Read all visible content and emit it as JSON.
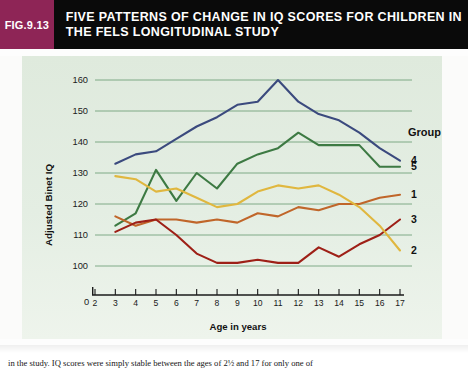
{
  "header": {
    "figure_tag": "FIG.9.13",
    "title_line1": "FIVE PATTERNS OF CHANGE IN IQ SCORES FOR CHILDREN IN",
    "title_line2": "THE FELS LONGITUDINAL STUDY",
    "tag_color": "#8e2556",
    "bar_color": "#0a0a0a"
  },
  "source_credit": "Source: McCall et al. (1973).",
  "caption": {
    "text": "in the study. IQ scores were simply stable between the ages of 2½ and 17 for only one of"
  },
  "legend": {
    "title": "Group",
    "entries": [
      {
        "label": "4",
        "color": "#3b4a7e"
      },
      {
        "label": "5",
        "color": "#3d7a43"
      },
      {
        "label": "1",
        "color": "#c0662a"
      },
      {
        "label": "3",
        "color": "#9e2017"
      },
      {
        "label": "2",
        "color": "#e0b73f"
      }
    ]
  },
  "chart_data": {
    "type": "line",
    "title": "Five patterns of change in IQ scores for children in the Fels Longitudinal Study",
    "xlabel": "Age in years",
    "ylabel": "Adjusted Binet IQ",
    "xlim": [
      2,
      17
    ],
    "ylim": [
      95,
      165
    ],
    "y_axis_origin_label": "0",
    "yticks": [
      100,
      110,
      120,
      130,
      140,
      150,
      160
    ],
    "xticks": [
      2,
      3,
      4,
      5,
      6,
      7,
      8,
      9,
      10,
      11,
      12,
      13,
      14,
      15,
      16,
      17
    ],
    "grid": true,
    "grid_color": "#4e8a5a",
    "legend_position": "right",
    "x": [
      3,
      4,
      5,
      6,
      7,
      8,
      9,
      10,
      11,
      12,
      13,
      14,
      15,
      16,
      17
    ],
    "series": [
      {
        "name": "Group 4",
        "label": "4",
        "color": "#3b4a7e",
        "x": [
          3,
          4,
          5,
          6,
          7,
          8,
          9,
          10,
          11,
          12,
          13,
          14,
          15,
          16,
          17
        ],
        "values": [
          133,
          136,
          137,
          141,
          145,
          148,
          152,
          153,
          160,
          153,
          149,
          147,
          143,
          138,
          134
        ]
      },
      {
        "name": "Group 5",
        "label": "5",
        "color": "#3d7a43",
        "x": [
          3,
          4,
          5,
          6,
          7,
          8,
          9,
          10,
          11,
          12,
          13,
          14,
          15,
          16,
          17
        ],
        "values": [
          113,
          117,
          131,
          121,
          130,
          125,
          133,
          136,
          138,
          143,
          139,
          139,
          139,
          132,
          132
        ]
      },
      {
        "name": "Group 1",
        "label": "1",
        "color": "#c0662a",
        "x": [
          3,
          4,
          5,
          6,
          7,
          8,
          9,
          10,
          11,
          12,
          13,
          14,
          15,
          16,
          17
        ],
        "values": [
          116,
          113,
          115,
          115,
          114,
          115,
          114,
          117,
          116,
          119,
          118,
          120,
          120,
          122,
          123
        ]
      },
      {
        "name": "Group 3",
        "label": "3",
        "color": "#9e2017",
        "x": [
          3,
          4,
          5,
          6,
          7,
          8,
          9,
          10,
          11,
          12,
          13,
          14,
          15,
          16,
          17
        ],
        "values": [
          111,
          114,
          115,
          110,
          104,
          101,
          101,
          102,
          101,
          101,
          106,
          103,
          107,
          110,
          115
        ]
      },
      {
        "name": "Group 2",
        "label": "2",
        "color": "#e0b73f",
        "x": [
          3,
          4,
          5,
          6,
          7,
          8,
          9,
          10,
          11,
          12,
          13,
          14,
          15,
          16,
          17
        ],
        "values": [
          129,
          128,
          124,
          125,
          122,
          119,
          120,
          124,
          126,
          125,
          126,
          123,
          119,
          113,
          105
        ]
      }
    ]
  }
}
